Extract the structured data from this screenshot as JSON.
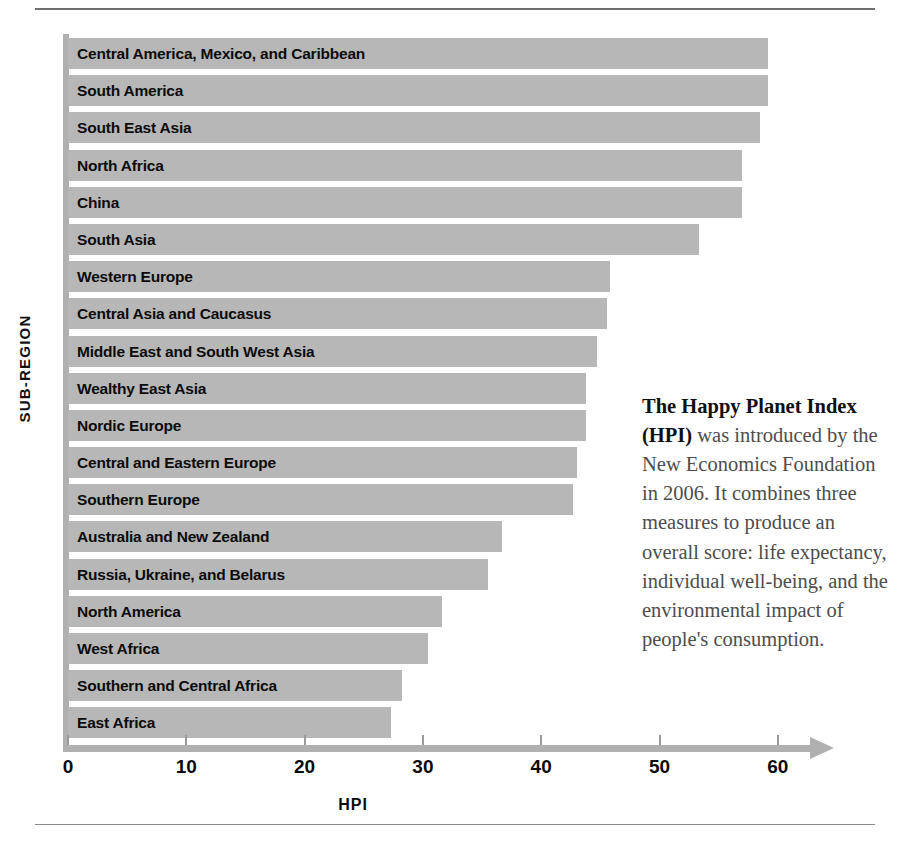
{
  "chart_data": {
    "type": "bar",
    "orientation": "horizontal",
    "title": "",
    "xlabel": "HPI",
    "ylabel": "SUB-REGION",
    "xlim": [
      0,
      63
    ],
    "xticks": [
      0,
      10,
      20,
      30,
      40,
      50,
      60
    ],
    "xtick_labels": [
      "0",
      "10",
      "20",
      "30",
      "40",
      "50",
      "60"
    ],
    "grid": false,
    "legend": null,
    "bar_color": "#b7b7b7",
    "axis_color": "#b0b0b0",
    "categories": [
      "Central America, Mexico, and Caribbean",
      "South America",
      "South East Asia",
      "North Africa",
      "China",
      "South Asia",
      "Western Europe",
      "Central Asia and Caucasus",
      "Middle East and South West Asia",
      "Wealthy East Asia",
      "Nordic Europe",
      "Central and Eastern Europe",
      "Southern Europe",
      "Australia and New Zealand",
      "Russia, Ukraine, and Belarus",
      "North America",
      "West Africa",
      "Southern and Central Africa",
      "East Africa"
    ],
    "values": [
      59.2,
      59.2,
      58.5,
      57.0,
      57.0,
      53.3,
      45.8,
      45.6,
      44.7,
      43.8,
      43.8,
      43.0,
      42.7,
      36.7,
      35.5,
      31.6,
      30.4,
      28.2,
      27.3
    ]
  },
  "side_note": {
    "lead": "The Happy Planet Index (HPI)",
    "body": " was introduced by the New Economics Foundation in 2006. It combines three measures to produce an overall score: life expectancy, individual well-being, and the environmental impact of people's consumption."
  }
}
